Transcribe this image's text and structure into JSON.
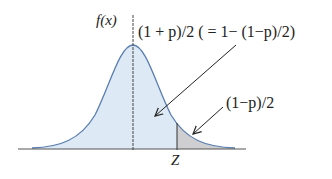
{
  "diagram": {
    "type": "normal-distribution",
    "labels": {
      "y_axis": "f(x)",
      "central_area": "(1 + p)/2 ( = 1− (1−p)/2)",
      "tail_area": "(1−p)/2",
      "z_point": "Z"
    },
    "colors": {
      "curve": "#5b7fb0",
      "central_fill": "#dde9f4",
      "tail_fill": "#cfcfd2",
      "axis": "#555555",
      "arrow": "#222222"
    }
  }
}
